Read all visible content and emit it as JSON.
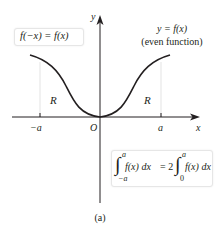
{
  "diagram": {
    "caption": "(a)",
    "axes": {
      "x_label": "x",
      "y_label": "y",
      "origin_label": "O",
      "tick_neg": "−a",
      "tick_pos": "a"
    },
    "curve_label_line1": "y = f(x)",
    "curve_label_line2": "(even function)",
    "region_left": "R",
    "region_right": "R",
    "symmetry_box": "f(−x) = f(x)",
    "integral_box": {
      "lhs_upper": "a",
      "lhs_lower": "−a",
      "lhs_integrand": "f(x) dx",
      "equals": "= 2",
      "rhs_upper": "a",
      "rhs_lower": "0",
      "rhs_integrand": "f(x) dx"
    },
    "colors": {
      "ink": "#231f20",
      "box_border": "#e6e6e6",
      "guide": "#d9d9d9"
    }
  }
}
